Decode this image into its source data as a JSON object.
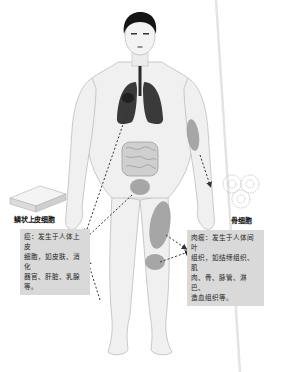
{
  "diagram": {
    "colors": {
      "background": "#ffffff",
      "skin": "#efefef",
      "skin_outline": "#b8b8b8",
      "hair": "#151515",
      "lungs": "#3a3a3a",
      "intestine": "#c9c9c9",
      "tumor_region": "#9a9a9a",
      "infobox_bg": "#d9d9d9",
      "arrow": "#333333",
      "fold_line": "#e6e6e6"
    },
    "left": {
      "cell_label": "鳞状上皮细胞",
      "cell_type": "squamous-epithelial-cells",
      "info_lines": [
        "癌：发生于人体上皮",
        "细胞，如皮肤、消化",
        "器官、肝脏、乳腺等。"
      ]
    },
    "right": {
      "cell_label": "骨细胞",
      "cell_type": "bone-cells",
      "info_lines": [
        "肉瘤：发生于人体间叶",
        "组织，如结缔组织、肌",
        "肉、骨、脉管、淋巴、",
        "造血组织等。"
      ]
    }
  }
}
